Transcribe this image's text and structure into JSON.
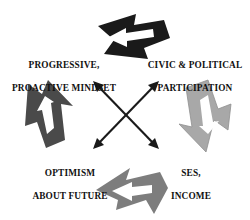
{
  "diagram": {
    "title_clipped": "",
    "type": "cyclical-relationship-diagram",
    "background": "#ffffff",
    "nodes": [
      {
        "id": "progressive",
        "position": "top-left",
        "line1": "PROGRESSIVE,",
        "line2": "PROACTIVE MINDSET"
      },
      {
        "id": "civic",
        "position": "top-right",
        "line1": "CIVIC & POLITICAL",
        "line2": "PARTICIPATION"
      },
      {
        "id": "optimism",
        "position": "bottom-left",
        "line1": "OPTIMISM",
        "line2": "ABOUT FUTURE"
      },
      {
        "id": "ses",
        "position": "bottom-right",
        "line1": "SES,",
        "line2": "INCOME"
      }
    ],
    "connectors": [
      {
        "id": "top-arrow",
        "connects": [
          "progressive",
          "civic"
        ],
        "direction": "bidirectional",
        "orientation": "horizontal",
        "fill": "#1a1a1a",
        "inner_fill": "#ffffff"
      },
      {
        "id": "left-arrow",
        "connects": [
          "progressive",
          "optimism"
        ],
        "direction": "bidirectional",
        "orientation": "vertical",
        "fill": "#4a4a4a",
        "inner_fill": "#ffffff"
      },
      {
        "id": "right-arrow",
        "connects": [
          "civic",
          "ses"
        ],
        "direction": "bidirectional",
        "orientation": "vertical",
        "fill": "#a8a8a8",
        "inner_fill": "#ffffff"
      },
      {
        "id": "bottom-arrow",
        "connects": [
          "optimism",
          "ses"
        ],
        "direction": "bidirectional",
        "orientation": "horizontal",
        "fill": "#7d7d7d",
        "inner_fill": "#ffffff"
      },
      {
        "id": "cross-arrow-a",
        "connects": [
          "progressive",
          "ses"
        ],
        "direction": "bidirectional",
        "orientation": "diagonal",
        "fill": "#1a1a1a"
      },
      {
        "id": "cross-arrow-b",
        "connects": [
          "civic",
          "optimism"
        ],
        "direction": "bidirectional",
        "orientation": "diagonal",
        "fill": "#1a1a1a"
      }
    ]
  }
}
